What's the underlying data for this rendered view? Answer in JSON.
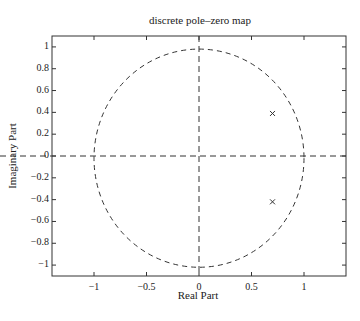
{
  "chart_data": {
    "type": "scatter",
    "title": "discrete pole–zero map",
    "xlabel": "Real Part",
    "ylabel": "Imaginary Part",
    "xlim": [
      -1.4,
      1.4
    ],
    "ylim": [
      -1.1,
      1.1
    ],
    "xticks": [
      -1,
      -0.5,
      0,
      0.5,
      1
    ],
    "xtick_labels": [
      "−1",
      "−0.5",
      "0",
      "0.5",
      "1"
    ],
    "yticks": [
      1,
      0.8,
      0.6,
      0.4,
      0.2,
      0,
      -0.2,
      -0.4,
      -0.6,
      -0.8,
      -1
    ],
    "ytick_labels": [
      "1",
      "0.8",
      "0.6",
      "0.4",
      "0.2",
      "0",
      "−0.2",
      "−0.4",
      "−0.6",
      "−0.8",
      "−1"
    ],
    "grid": false,
    "series": [
      {
        "name": "poles",
        "marker": "x",
        "points": [
          {
            "x": 0.7,
            "y": 0.39
          },
          {
            "x": 0.7,
            "y": -0.42
          }
        ]
      },
      {
        "name": "unit circle",
        "style": "dashed",
        "center": {
          "x": 0,
          "y": -0.02
        },
        "radius": 1
      }
    ],
    "reference_lines": [
      {
        "orientation": "horizontal",
        "value": 0,
        "style": "dashed"
      },
      {
        "orientation": "vertical",
        "value": 0,
        "style": "dashed"
      }
    ]
  },
  "colors": {
    "line": "#333333",
    "background": "#ffffff"
  }
}
